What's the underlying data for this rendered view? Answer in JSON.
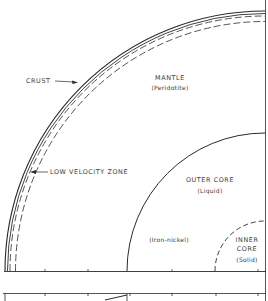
{
  "diagram": {
    "type": "earth-cross-section-quadrant",
    "colors": {
      "line": "#2a2a2a",
      "text": "#3a3a3a",
      "background": "#ffffff"
    },
    "layers": {
      "crust": {
        "label": "CRUST"
      },
      "mantle": {
        "label": "MANTLE",
        "composition": "(Peridotite)"
      },
      "low_velocity_zone": {
        "label": "LOW VELOCITY ZONE"
      },
      "outer_core": {
        "label": "OUTER CORE",
        "state": "(Liquid)",
        "composition": "(Iron-nickel)"
      },
      "inner_core": {
        "label_line1": "INNER",
        "label_line2": "CORE",
        "state": "(Solid)"
      }
    }
  }
}
